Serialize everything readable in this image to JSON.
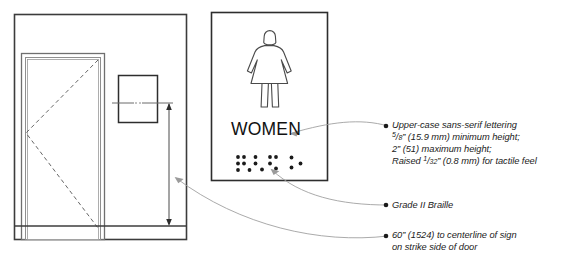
{
  "diagram": {
    "stroke_color": "#3c3c3c",
    "leader_color": "#8a8a8a",
    "text_color": "#1b1b1b"
  },
  "door_elevation": {
    "name": "door-elevation",
    "wall_label": "wall",
    "door_label": "door",
    "swing_label": "door swing",
    "sign_label": "sign",
    "dimension_label": "mounting height dimension"
  },
  "sign_panel": {
    "name": "restroom-sign-panel",
    "pictogram": "female-figure-icon",
    "word": "WOMEN",
    "braille": {
      "label": "grade-2-braille-dots",
      "cells": [
        [
          1,
          1,
          1,
          0,
          1,
          0
        ],
        [
          1,
          0,
          0,
          0,
          1,
          0
        ],
        [
          1,
          1,
          1,
          1,
          0,
          0
        ],
        [
          0,
          0,
          1,
          0,
          1,
          0
        ],
        [
          1,
          0,
          0,
          0,
          0,
          1
        ]
      ]
    }
  },
  "notes": {
    "lettering": {
      "bullet": "•",
      "line1": "Upper-case sans-serif lettering",
      "line2_pre": "",
      "line2_num": "5",
      "line2_den": "8",
      "line2_post": "” (15.9 mm) minimum height;",
      "line3": "2” (51) maximum height;",
      "line4_pre": "Raised ",
      "line4_num": "1",
      "line4_den": "32",
      "line4_post": "” (0.8 mm) for tactile feel"
    },
    "braille": {
      "bullet": "•",
      "line1": "Grade II Braille"
    },
    "mounting": {
      "bullet": "•",
      "line1": "60” (1524) to centerline of sign",
      "line2": "on strike side of door"
    }
  }
}
